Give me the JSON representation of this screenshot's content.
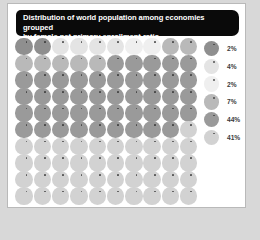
{
  "header": {
    "title": "Distribution of world population among economies grouped\nby female net primary enrollment ratio"
  },
  "chart_data": {
    "type": "pie",
    "title": "Distribution of world population among economies grouped by female net primary enrollment ratio",
    "subtitle": "",
    "xlabel": "",
    "ylabel": "",
    "unit": "percent of world population",
    "grid": "10 columns x 10 rows of unit markers",
    "legend_position": "right",
    "categories": [
      "group-1",
      "group-2",
      "group-3",
      "group-4",
      "group-5",
      "group-6"
    ],
    "values": [
      2,
      4,
      2,
      7,
      44,
      41
    ],
    "labels": [
      "2%",
      "4%",
      "2%",
      "7%",
      "44%",
      "41%"
    ],
    "colors": [
      "#8f8f8f",
      "#e4e4e4",
      "#efefef",
      "#b9b9b9",
      "#9a9a9a",
      "#d2d2d2"
    ],
    "total": 100,
    "marker_count": 100,
    "columns": 10,
    "rows": 10
  },
  "legend": {
    "items": [
      {
        "label": "2%",
        "color": "#8f8f8f"
      },
      {
        "label": "4%",
        "color": "#e4e4e4"
      },
      {
        "label": "2%",
        "color": "#efefef"
      },
      {
        "label": "7%",
        "color": "#b9b9b9"
      },
      {
        "label": "44%",
        "color": "#9a9a9a"
      },
      {
        "label": "41%",
        "color": "#d2d2d2"
      }
    ]
  },
  "colors": {
    "header_background": "#0a0a0a",
    "header_text": "#ffffff",
    "panel_background": "#ffffff",
    "page_background": "#d8d8d8",
    "panel_border": "#b9b9b9"
  }
}
